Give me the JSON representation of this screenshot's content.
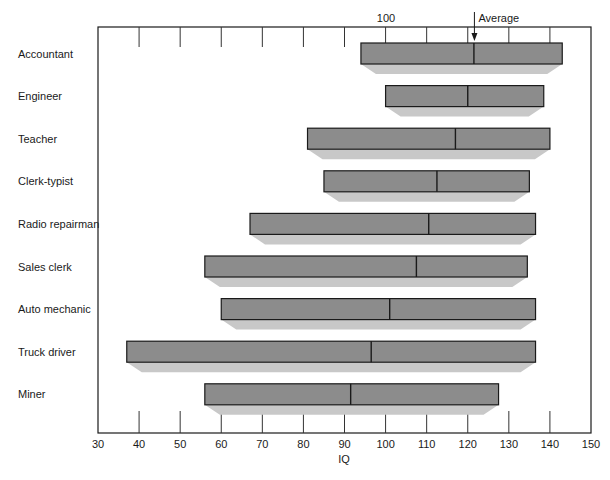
{
  "chart_data": {
    "type": "bar",
    "subtype": "floating-range-with-marker",
    "title": "",
    "xlabel": "IQ",
    "ylabel": "",
    "xlim": [
      30,
      150
    ],
    "x_ticks": [
      30,
      40,
      50,
      60,
      70,
      80,
      90,
      100,
      110,
      120,
      130,
      140,
      150
    ],
    "top_annotation": {
      "tick_label": "100",
      "marker_label": "Average",
      "marker_value": 121.5
    },
    "grid": false,
    "legend": null,
    "categories": [
      "Accountant",
      "Engineer",
      "Teacher",
      "Clerk-typist",
      "Radio repairman",
      "Sales clerk",
      "Auto mechanic",
      "Truck driver",
      "Miner"
    ],
    "series": [
      {
        "name": "Minimum IQ",
        "values": [
          94,
          100,
          81,
          85,
          67,
          56,
          60,
          37,
          56
        ]
      },
      {
        "name": "Average IQ",
        "values": [
          121.5,
          120,
          117,
          112.5,
          110.5,
          107.5,
          101,
          96.5,
          91.5
        ]
      },
      {
        "name": "Maximum IQ",
        "values": [
          143,
          138.5,
          140,
          135,
          136.5,
          134.5,
          136.5,
          136.5,
          127.5
        ]
      }
    ],
    "colors": {
      "bar": "#8c8c8c",
      "shadow": "#c8c8c8",
      "frame": "#1a1a1a"
    }
  }
}
